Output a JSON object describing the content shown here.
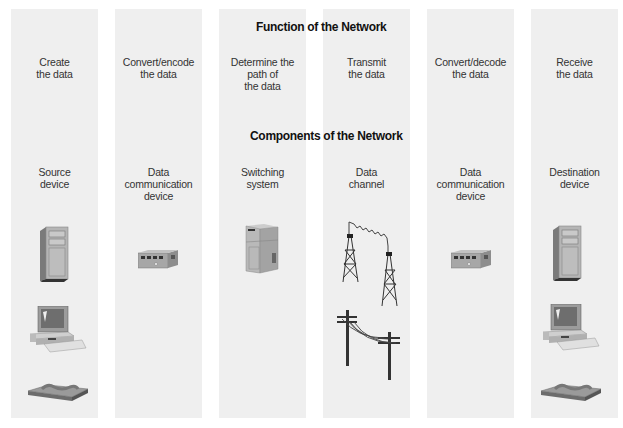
{
  "headings": {
    "function": "Function of the Network",
    "components": "Components of the Network"
  },
  "columns": [
    {
      "function": "Create\nthe data",
      "component": "Source\ndevice",
      "icons": [
        "server-tower-icon",
        "desktop-computer-icon",
        "telephone-icon"
      ]
    },
    {
      "function": "Convert/encode\nthe data",
      "component": "Data\ncommunication\ndevice",
      "icons": [
        "modem-icon"
      ]
    },
    {
      "function": "Determine the\npath of\nthe data",
      "component": "Switching\nsystem",
      "icons": [
        "switching-cabinet-icon"
      ]
    },
    {
      "function": "Transmit\nthe data",
      "component": "Data\nchannel",
      "icons": [
        "microwave-towers-icon",
        "telephone-poles-icon"
      ]
    },
    {
      "function": "Convert/decode\nthe data",
      "component": "Data\ncommunication\ndevice",
      "icons": [
        "modem-icon"
      ]
    },
    {
      "function": "Receive\nthe data",
      "component": "Destination\ndevice",
      "icons": [
        "server-tower-icon",
        "desktop-computer-icon",
        "telephone-icon"
      ]
    }
  ],
  "colors": {
    "column_bg": "#efefef",
    "device_gray": "#a9a9a9",
    "device_dark": "#555555"
  }
}
